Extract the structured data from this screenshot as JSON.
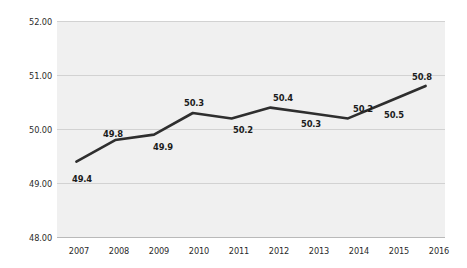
{
  "chart_data": {
    "type": "line",
    "title": "",
    "subtitle": "",
    "xlabel": "",
    "ylabel": "",
    "categories": [
      "2007",
      "2008",
      "2009",
      "2010",
      "2011",
      "2012",
      "2013",
      "2014",
      "2015",
      "2016"
    ],
    "values": [
      49.4,
      49.8,
      49.9,
      50.3,
      50.2,
      50.4,
      50.3,
      50.2,
      50.5,
      50.8
    ],
    "point_labels": [
      "49.4",
      "49.8",
      "49.9",
      "50.3",
      "50.2",
      "50.4",
      "50.3",
      "50.2",
      "50.5",
      "50.8"
    ],
    "point_label_position": [
      "below",
      "above",
      "below",
      "above",
      "below",
      "above",
      "below",
      "above",
      "below",
      "above"
    ],
    "ylim": [
      48.0,
      52.0
    ],
    "y_ticks": [
      48.0,
      49.0,
      50.0,
      51.0,
      52.0
    ],
    "y_tick_labels": [
      "48.00",
      "49.00",
      "50.00",
      "51.00",
      "52.00"
    ],
    "x_tick_labels": [
      "2007",
      "2008",
      "2009",
      "2010",
      "2011",
      "2012",
      "2013",
      "2014",
      "2015",
      "2016"
    ],
    "grid": true,
    "grid_axis": "y",
    "legend": false,
    "legend_position": "none",
    "series": [
      {
        "name": "",
        "values": [
          49.4,
          49.8,
          49.9,
          50.3,
          50.2,
          50.4,
          50.3,
          50.2,
          50.5,
          50.8
        ]
      }
    ],
    "colors": {
      "line": "#2e2e2e",
      "plot_background": "#f0f0f0",
      "page_background": "#ffffff",
      "gridline": "#d2d2d2",
      "tick_label": "#2b2b2b",
      "data_label": "#1c1c1c"
    },
    "markers": false,
    "annotations": []
  }
}
